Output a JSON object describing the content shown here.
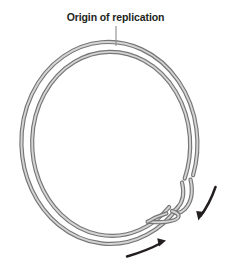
{
  "figure": {
    "title": "Origin of replication",
    "label": {
      "text": "Origin of replication",
      "name": "origin-of-replication-label",
      "x_center": 115,
      "y": 18,
      "color": "#231f20",
      "font_size_px": 10.5
    },
    "leader_line": {
      "name": "leader-line",
      "from_x": 116,
      "from_y": 26,
      "to_x": 116,
      "to_y": 45,
      "color": "#8c8c8c"
    },
    "circle": {
      "name": "dna-circle",
      "center_x": 112,
      "center_y": 146,
      "outer_radius_x": 88,
      "outer_radius_y": 101,
      "inner_radius_x": 79,
      "inner_radius_y": 92,
      "strand_color_dark": "#6e6e6e",
      "strand_color_light": "#c9c9c9",
      "strand_width_px": 3.2
    },
    "replication_fork": {
      "name": "replication-fork",
      "x": 178,
      "y": 212,
      "description": "Two strands separate at lower right forming a Y-shaped fork"
    },
    "arrows": [
      {
        "name": "replication-arrow-right",
        "direction": "down-left",
        "tip_x": 198,
        "tip_y": 219,
        "tail_x": 216,
        "tail_y": 188,
        "color": "#231f20"
      },
      {
        "name": "replication-arrow-bottom",
        "direction": "up-right",
        "tip_x": 164,
        "tip_y": 242,
        "tail_x": 127,
        "tail_y": 256,
        "color": "#231f20"
      }
    ],
    "background_color": "#ffffff"
  }
}
